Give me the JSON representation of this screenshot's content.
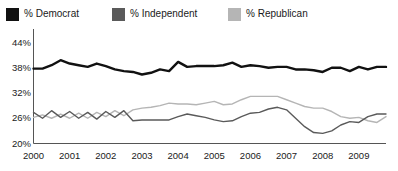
{
  "legend": {
    "position": "top-left",
    "items": [
      {
        "label": "% Democrat",
        "color": "#111111"
      },
      {
        "label": "% Independent",
        "color": "#5a5a5a"
      },
      {
        "label": "% Republican",
        "color": "#b5b5b5"
      }
    ]
  },
  "axes": {
    "y_ticks": [
      "20%",
      "26%",
      "32%",
      "38%",
      "44%"
    ],
    "x_ticks": [
      "2000",
      "2001",
      "2002",
      "2003",
      "2004",
      "2005",
      "2006",
      "2007",
      "2008",
      "2009"
    ]
  },
  "chart_data": {
    "type": "line",
    "title": "",
    "subtitle": "",
    "xlabel": "",
    "ylabel": "",
    "ylim": [
      20,
      44
    ],
    "xlim": [
      2000,
      2009.75
    ],
    "y_tick_values": [
      20,
      26,
      32,
      38,
      44
    ],
    "y_tick_labels": [
      "20%",
      "26%",
      "32%",
      "38%",
      "44%"
    ],
    "x_tick_values": [
      2000,
      2001,
      2002,
      2003,
      2004,
      2005,
      2006,
      2007,
      2008,
      2009
    ],
    "x_tick_labels": [
      "2000",
      "2001",
      "2002",
      "2003",
      "2004",
      "2005",
      "2006",
      "2007",
      "2008",
      "2009"
    ],
    "grid": false,
    "legend_position": "above-plot-left",
    "x": [
      2000.0,
      2000.25,
      2000.5,
      2000.75,
      2001.0,
      2001.25,
      2001.5,
      2001.75,
      2002.0,
      2002.25,
      2002.5,
      2002.75,
      2003.0,
      2003.25,
      2003.5,
      2003.75,
      2004.0,
      2004.25,
      2004.5,
      2004.75,
      2005.0,
      2005.25,
      2005.5,
      2005.75,
      2006.0,
      2006.25,
      2006.5,
      2006.75,
      2007.0,
      2007.25,
      2007.5,
      2007.75,
      2008.0,
      2008.25,
      2008.5,
      2008.75,
      2009.0,
      2009.25,
      2009.5,
      2009.75
    ],
    "series": [
      {
        "name": "% Democrat",
        "color": "#111111",
        "values": [
          37.8,
          37.8,
          38.6,
          39.8,
          39.0,
          38.6,
          38.2,
          39.0,
          38.4,
          37.6,
          37.2,
          37.0,
          36.4,
          36.8,
          37.6,
          37.2,
          39.4,
          38.2,
          38.4,
          38.4,
          38.4,
          38.6,
          39.2,
          38.2,
          38.6,
          38.4,
          38.0,
          38.2,
          38.2,
          37.6,
          37.6,
          37.4,
          37.0,
          38.0,
          38.0,
          37.2,
          38.2,
          37.6,
          38.2,
          38.2
        ]
      },
      {
        "name": "% Independent",
        "color": "#5a5a5a",
        "values": [
          27.4,
          26.0,
          27.8,
          26.2,
          27.6,
          26.0,
          27.4,
          25.8,
          27.6,
          26.2,
          27.8,
          25.4,
          25.6,
          25.6,
          25.6,
          25.6,
          26.4,
          27.0,
          26.6,
          26.2,
          25.6,
          25.2,
          25.4,
          26.4,
          27.2,
          27.4,
          28.2,
          28.6,
          28.0,
          26.0,
          24.0,
          22.6,
          22.4,
          23.0,
          24.4,
          25.2,
          25.0,
          26.4,
          27.0,
          27.0
        ]
      },
      {
        "name": "% Republican",
        "color": "#b5b5b5",
        "values": [
          26.2,
          26.8,
          26.0,
          27.0,
          26.0,
          27.2,
          26.0,
          27.4,
          26.4,
          27.8,
          26.6,
          28.0,
          28.4,
          28.6,
          29.0,
          29.6,
          29.4,
          29.4,
          29.2,
          29.6,
          30.0,
          29.2,
          29.4,
          30.4,
          31.2,
          31.2,
          31.2,
          31.2,
          30.4,
          29.6,
          28.8,
          28.4,
          28.4,
          27.6,
          26.4,
          26.0,
          26.2,
          25.4,
          25.0,
          26.4
        ]
      }
    ]
  }
}
